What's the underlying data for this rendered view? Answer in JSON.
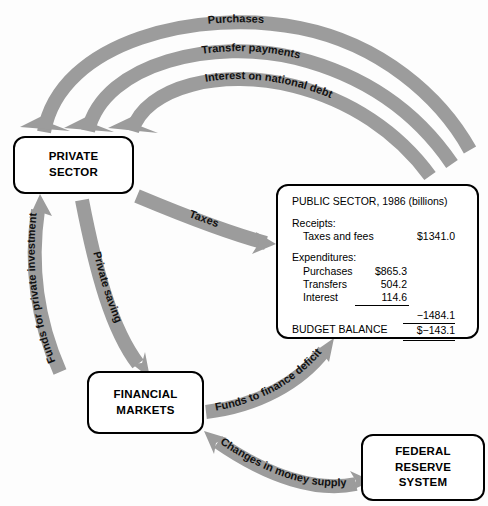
{
  "diagram": {
    "arrow_color": "#9c9c9c",
    "box_border_color": "#000000",
    "background": "#fdfdfd"
  },
  "nodes": {
    "private_sector": {
      "line1": "PRIVATE",
      "line2": "SECTOR"
    },
    "financial_markets": {
      "line1": "FINANCIAL",
      "line2": "MARKETS"
    },
    "federal_reserve": {
      "line1": "FEDERAL",
      "line2": "RESERVE",
      "line3": "SYSTEM"
    }
  },
  "public_sector": {
    "title": "PUBLIC SECTOR, 1986 (billions)",
    "receipts_head": "Receipts:",
    "receipts": [
      {
        "label": "Taxes and fees",
        "amount": "$1341.0"
      }
    ],
    "expenditures_head": "Expenditures:",
    "expenditures": [
      {
        "label": "Purchases",
        "amount": "$865.3"
      },
      {
        "label": "Transfers",
        "amount": "504.2"
      },
      {
        "label": "Interest",
        "amount": "114.6"
      }
    ],
    "expenditures_total": "−1484.1",
    "balance_label": "BUDGET BALANCE",
    "balance_amount": "$−143.1"
  },
  "flows": [
    {
      "id": "purchases",
      "label": "Purchases",
      "from": "public_sector",
      "to": "private_sector"
    },
    {
      "id": "transfer-payments",
      "label": "Transfer payments",
      "from": "public_sector",
      "to": "private_sector"
    },
    {
      "id": "interest-on-national-debt",
      "label": "Interest on national debt",
      "from": "public_sector",
      "to": "private_sector"
    },
    {
      "id": "taxes",
      "label": "Taxes",
      "from": "private_sector",
      "to": "public_sector"
    },
    {
      "id": "private-saving",
      "label": "Private saving",
      "from": "private_sector",
      "to": "financial_markets"
    },
    {
      "id": "funds-for-private-investment",
      "label": "Funds for private investment",
      "from": "financial_markets",
      "to": "private_sector"
    },
    {
      "id": "funds-to-finance-deficit",
      "label": "Funds to finance deficit",
      "from": "financial_markets",
      "to": "public_sector"
    },
    {
      "id": "changes-in-money-supply",
      "label": "Changes in money supply",
      "from": "federal_reserve",
      "to": "financial_markets",
      "bidirectional": true
    }
  ]
}
